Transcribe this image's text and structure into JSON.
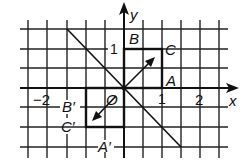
{
  "figure": {
    "type": "coordinate-grid-reflection",
    "axes": {
      "x_label": "x",
      "y_label": "y",
      "origin_label": "O",
      "x_ticks": [
        {
          "label": "-2",
          "value": -2
        },
        {
          "label": "1",
          "value": 1
        },
        {
          "label": "2",
          "value": 2
        }
      ],
      "y_ticks": [
        {
          "label": "1",
          "value": 1
        }
      ]
    },
    "grid": {
      "cell_size_units": 0.5,
      "x_range": [
        -2.5,
        2.5
      ],
      "y_range": [
        -1.5,
        1.5
      ]
    },
    "shapes": {
      "original_square": {
        "vertices": [
          {
            "label": "O",
            "x": 0,
            "y": 0
          },
          {
            "label": "A",
            "x": 1,
            "y": 0
          },
          {
            "label": "C",
            "x": 1,
            "y": 1
          },
          {
            "label": "B",
            "x": 0,
            "y": 1
          }
        ]
      },
      "image_square": {
        "vertices": [
          {
            "label": "O",
            "x": 0,
            "y": 0
          },
          {
            "label": "A'",
            "x": 0,
            "y": -1
          },
          {
            "label": "C'",
            "x": -1,
            "y": -1
          },
          {
            "label": "B'",
            "x": -1,
            "y": 0
          }
        ]
      }
    },
    "reflection_line": {
      "equation": "y = -x"
    },
    "arrows": [
      {
        "direction": "toward C",
        "from": [
          0,
          0
        ],
        "to": [
          0.8,
          0.8
        ]
      },
      {
        "direction": "toward C'",
        "from": [
          -0.2,
          -0.2
        ],
        "to": [
          -0.8,
          -0.8
        ]
      }
    ],
    "labels": {
      "A": "A",
      "B": "B",
      "C": "C",
      "A_prime": "A′",
      "B_prime": "B′",
      "C_prime": "C′",
      "O": "O",
      "x": "x",
      "y": "y",
      "tick_neg2": "−2",
      "tick_x1": "1",
      "tick_x2": "2",
      "tick_y1": "1"
    }
  }
}
